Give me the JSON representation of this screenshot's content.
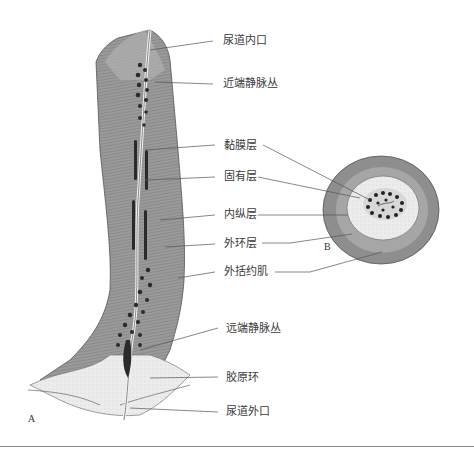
{
  "figure": {
    "panel_a_label": "A",
    "panel_b_label": "B",
    "labels": [
      {
        "id": "internal-urethral-orifice",
        "text": "尿道内口"
      },
      {
        "id": "proximal-venous-plexus",
        "text": "近端静脉丛"
      },
      {
        "id": "mucosa",
        "text": "黏膜层"
      },
      {
        "id": "lamina-propria",
        "text": "固有层"
      },
      {
        "id": "inner-longitudinal-layer",
        "text": "内纵层"
      },
      {
        "id": "outer-circular-layer",
        "text": "外环层"
      },
      {
        "id": "external-sphincter",
        "text": "外括约肌"
      },
      {
        "id": "distal-venous-plexus",
        "text": "远端静脉丛"
      },
      {
        "id": "collagen-ring",
        "text": "胶原环"
      },
      {
        "id": "external-urethral-orifice",
        "text": "尿道外口"
      }
    ]
  }
}
